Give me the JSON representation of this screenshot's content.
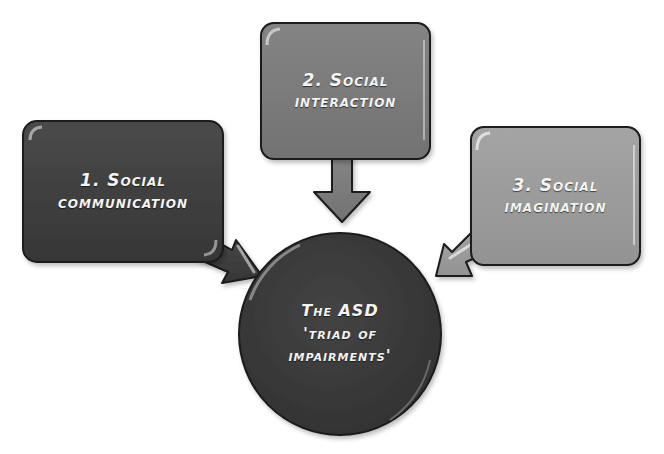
{
  "diagram": {
    "boxes": [
      {
        "id": "1",
        "line1": "1. Social",
        "line2": "communication",
        "fill": "#404040"
      },
      {
        "id": "2",
        "line1": "2. Social",
        "line2": "interaction",
        "fill": "#7b7b7b"
      },
      {
        "id": "3",
        "line1": "3. Social",
        "line2": "imagination",
        "fill": "#9c9c9c"
      }
    ],
    "center": {
      "line1": "The ASD",
      "line2": "'triad of",
      "line3": "impairments'",
      "fill": "#3b3b3b"
    },
    "colors": {
      "outline": "#1a1a1a",
      "text": "#f4f4f4",
      "background": "#ffffff"
    }
  }
}
